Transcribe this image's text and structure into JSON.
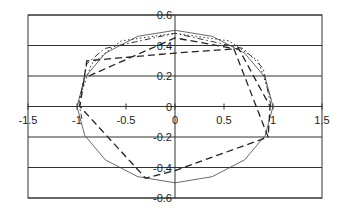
{
  "chart_data": {
    "type": "line",
    "title": "",
    "xlabel": "",
    "ylabel": "",
    "xlim": [
      -1.5,
      1.5
    ],
    "ylim": [
      -0.6,
      0.6
    ],
    "x_ticks": [
      "-1.5",
      "-1",
      "-0.5",
      "0",
      "0.5",
      "1",
      "1.5"
    ],
    "y_ticks": [
      "0.6",
      "0.4",
      "0.2",
      "0",
      "-0.2",
      "-0.4",
      "-0.6"
    ],
    "grid": {
      "horizontal": true,
      "vertical": false
    },
    "legend": null,
    "series": [
      {
        "name": "ellipse",
        "style": "solid-thin",
        "x": [
          1.0,
          0.92,
          0.71,
          0.38,
          0.0,
          -0.38,
          -0.71,
          -0.92,
          -1.0,
          -0.92,
          -0.71,
          -0.38,
          0.0,
          0.38,
          0.71,
          0.92,
          1.0
        ],
        "y": [
          0.0,
          0.19,
          0.35,
          0.46,
          0.5,
          0.46,
          0.35,
          0.19,
          0.0,
          -0.19,
          -0.35,
          -0.46,
          -0.5,
          -0.46,
          -0.35,
          -0.19,
          0.0
        ]
      },
      {
        "name": "dotted",
        "style": "dotted",
        "x": [
          0.98,
          0.85,
          0.55,
          0.0,
          -0.55,
          -0.85,
          -0.98
        ],
        "y": [
          0.05,
          0.3,
          0.43,
          0.48,
          0.43,
          0.28,
          0.05
        ]
      },
      {
        "name": "dash-dot",
        "style": "dash-dot",
        "x": [
          0.98,
          0.9,
          0.7,
          0.0,
          -0.72,
          -0.9,
          -0.98,
          -0.95
        ],
        "y": [
          0.0,
          0.25,
          0.38,
          0.48,
          0.38,
          0.28,
          0.02,
          -0.08
        ]
      },
      {
        "name": "dashed",
        "style": "dashed",
        "x": [
          -0.88,
          0.0,
          0.6,
          0.95,
          0.0,
          -0.3,
          -0.97,
          -0.9,
          0.0,
          0.65,
          0.97,
          0.95
        ],
        "y": [
          0.2,
          0.45,
          0.38,
          -0.2,
          -0.42,
          -0.47,
          0.0,
          0.3,
          0.35,
          0.38,
          0.0,
          -0.2
        ]
      }
    ]
  }
}
